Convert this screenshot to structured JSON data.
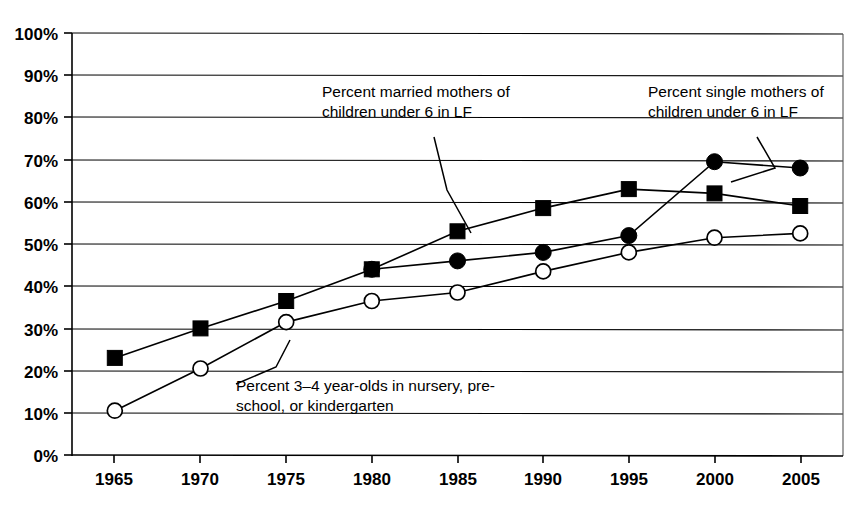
{
  "chart_data": {
    "type": "line",
    "title": "",
    "xlabel": "",
    "ylabel": "",
    "categories": [
      "1965",
      "1970",
      "1975",
      "1980",
      "1985",
      "1990",
      "1995",
      "2000",
      "2005"
    ],
    "x": [
      1965,
      1970,
      1975,
      1980,
      1985,
      1990,
      1995,
      2000,
      2005
    ],
    "xlim": [
      1962.5,
      2007.5
    ],
    "ylim": [
      0,
      100
    ],
    "grid": true,
    "legend_position": "annotations-inline",
    "y_ticks": [
      0,
      10,
      20,
      30,
      40,
      50,
      60,
      70,
      80,
      90,
      100
    ],
    "y_tick_labels": [
      "0%",
      "10%",
      "20%",
      "30%",
      "40%",
      "50%",
      "60%",
      "70%",
      "80%",
      "90%",
      "100%"
    ],
    "x_tick_labels": [
      "1965",
      "1970",
      "1975",
      "1980",
      "1985",
      "1990",
      "1995",
      "2000",
      "2005"
    ],
    "series": [
      {
        "name": "Percent married mothers of children under 6 in LF",
        "marker": "filled-square",
        "values": [
          23,
          30,
          36.5,
          44,
          53,
          58.5,
          63,
          62,
          59
        ]
      },
      {
        "name": "Percent single mothers of children under 6 in LF",
        "marker": "filled-circle",
        "values": [
          null,
          null,
          null,
          44,
          46,
          48,
          52,
          69.5,
          68
        ]
      },
      {
        "name": "Percent 3–4 year-olds in nursery, pre-school, or kindergarten",
        "marker": "open-circle",
        "values": [
          10.5,
          20.5,
          31.5,
          36.5,
          38.5,
          43.5,
          48,
          51.5,
          52.5
        ]
      }
    ],
    "annotations": [
      {
        "id": "married-mothers",
        "line1": "Percent married mothers of",
        "line2": "children under 6 in LF"
      },
      {
        "id": "single-mothers",
        "line1": "Percent single mothers of",
        "line2": "children under 6 in LF"
      },
      {
        "id": "nursery-preschool",
        "line1": "Percent 3–4 year-olds in nursery, pre-",
        "line2": "school, or kindergarten"
      }
    ],
    "colors": {
      "line": "#000000",
      "grid": "#000000",
      "background": "#ffffff",
      "marker_fill": "#000000",
      "marker_open_fill": "#ffffff"
    }
  }
}
